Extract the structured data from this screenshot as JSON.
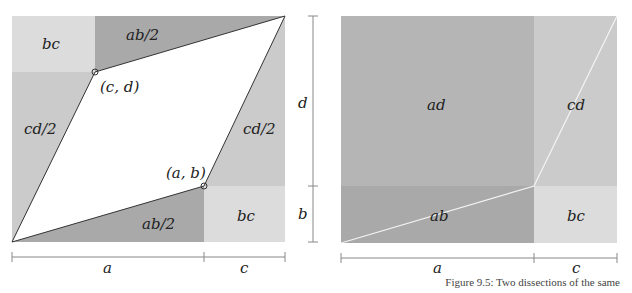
{
  "colors": {
    "light": "#dcdcdc",
    "mid": "#cbcbcb",
    "medium_dark": "#b5b5b5",
    "dark": "#a9a9a9",
    "outline": "#333333",
    "dimension": "#888888"
  },
  "left_figure": {
    "regions": {
      "top_left": "bc",
      "top_right": "ab/2",
      "left": "cd/2",
      "right": "cd/2",
      "bottom_left": "ab/2",
      "bottom_right": "bc"
    },
    "points": {
      "upper": "(c, d)",
      "lower": "(a, b)"
    },
    "dimensions": {
      "bottom_left": "a",
      "bottom_right": "c"
    }
  },
  "right_figure": {
    "regions": {
      "top_left": "ad",
      "top_right": "cd",
      "bottom_left": "ab",
      "bottom_right": "bc"
    },
    "dimensions": {
      "vertical_top": "d",
      "vertical_bottom": "b",
      "bottom_left": "a",
      "bottom_right": "c"
    }
  },
  "caption": "Figure 9.5: Two dissections of the same"
}
